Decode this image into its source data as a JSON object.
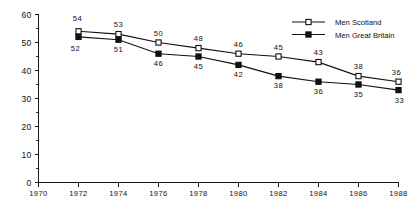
{
  "chart_data": {
    "type": "line",
    "title": "",
    "subtitle": "",
    "xlabel": "",
    "ylabel": "",
    "x": [
      1972,
      1974,
      1976,
      1978,
      1980,
      1982,
      1984,
      1986,
      1988
    ],
    "xlim": [
      1970,
      1988
    ],
    "ylim": [
      0,
      60
    ],
    "xticks": [
      1970,
      1972,
      1974,
      1976,
      1978,
      1980,
      1982,
      1984,
      1986,
      1988
    ],
    "xtick_labels": [
      "1970",
      "1972",
      "1974",
      "1976",
      "1978",
      "1980",
      "1982",
      "1984",
      "1986",
      "1988"
    ],
    "yticks": [
      0,
      10,
      20,
      30,
      40,
      50,
      60
    ],
    "ytick_labels": [
      "0",
      "10",
      "20",
      "30",
      "40",
      "50",
      "60"
    ],
    "y_minor_ticks": [
      5,
      15,
      25,
      35,
      45,
      55
    ],
    "grid": false,
    "legend_position": "upper right",
    "series": [
      {
        "name": "Men Scotland",
        "marker": "open-square",
        "label_position": "above",
        "values": [
          54,
          53,
          50,
          48,
          46,
          45,
          43,
          38,
          36
        ],
        "point_labels": [
          "54",
          "53",
          "50",
          "48",
          "46",
          "45",
          "43",
          "38",
          "36"
        ]
      },
      {
        "name": "Men Great Britain",
        "marker": "filled-square",
        "label_position": "below",
        "values": [
          52,
          51,
          46,
          45,
          42,
          38,
          36,
          35,
          33
        ],
        "point_labels": [
          "52",
          "51",
          "46",
          "45",
          "42",
          "38",
          "36",
          "35",
          "33"
        ]
      }
    ]
  },
  "legend": {
    "items": [
      {
        "label": "Men Scotland",
        "marker": "open-square"
      },
      {
        "label": "Men Great Britain",
        "marker": "filled-square"
      }
    ]
  },
  "colors": {
    "line": "#111111",
    "axis": "#1a1a1a",
    "background": "#ffffff",
    "marker_fill_open": "#ffffff",
    "marker_fill_closed": "#111111"
  }
}
